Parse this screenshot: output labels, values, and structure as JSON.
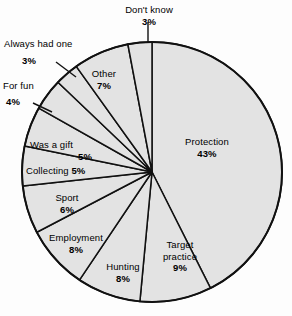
{
  "chart_data": {
    "type": "pie",
    "title": "",
    "subtitle": "",
    "xlabel": "",
    "ylabel": "",
    "legend_position": "none",
    "grid": false,
    "units": "percent",
    "start_angle_deg": 0,
    "direction": "clockwise",
    "categories": [
      "Protection",
      "Target practice",
      "Hunting",
      "Employment",
      "Sport",
      "Collecting",
      "Was a gift",
      "For fun",
      "Always had one",
      "Other",
      "Don't know"
    ],
    "values": [
      43,
      9,
      8,
      8,
      6,
      5,
      5,
      4,
      3,
      7,
      3
    ],
    "slices": [
      {
        "name": "Protection",
        "value": 43,
        "label": "Protection",
        "percent_label": "43%",
        "label_style": "inside-stacked"
      },
      {
        "name": "Target practice",
        "value": 9,
        "label": "Target",
        "label_line2": "practice",
        "percent_label": "9%",
        "label_style": "inside-stacked"
      },
      {
        "name": "Hunting",
        "value": 8,
        "label": "Hunting",
        "percent_label": "8%",
        "label_style": "inside-stacked"
      },
      {
        "name": "Employment",
        "value": 8,
        "label": "Employment",
        "percent_label": "8%",
        "label_style": "inside-stacked"
      },
      {
        "name": "Sport",
        "value": 6,
        "label": "Sport",
        "percent_label": "6%",
        "label_style": "inside-stacked"
      },
      {
        "name": "Collecting",
        "value": 5,
        "label": "Collecting",
        "percent_label": "5%",
        "label_style": "inside-inline"
      },
      {
        "name": "Was a gift",
        "value": 5,
        "label": "Was a gift",
        "percent_label": "5%",
        "label_style": "inside-stacked"
      },
      {
        "name": "For fun",
        "value": 4,
        "label": "For fun",
        "percent_label": "4%",
        "label_style": "outside-leader"
      },
      {
        "name": "Always had one",
        "value": 3,
        "label": "Always had one",
        "percent_label": "3%",
        "label_style": "outside-leader"
      },
      {
        "name": "Other",
        "value": 7,
        "label": "Other",
        "percent_label": "7%",
        "label_style": "inside-stacked"
      },
      {
        "name": "Don't know",
        "value": 3,
        "label": "Don't know",
        "percent_label": "3%",
        "label_style": "outside-leader"
      }
    ],
    "colors": {
      "slice_fill": "#e3e3e3",
      "slice_stroke": "#111111",
      "text": "#000000",
      "background": "#fdfdfd"
    }
  },
  "labels": {
    "protection": {
      "name": "Protection",
      "percent": "43%"
    },
    "target_practice": {
      "name": "Target",
      "name2": "practice",
      "percent": "9%"
    },
    "hunting": {
      "name": "Hunting",
      "percent": "8%"
    },
    "employment": {
      "name": "Employment",
      "percent": "8%"
    },
    "sport": {
      "name": "Sport",
      "percent": "6%"
    },
    "collecting": {
      "name": "Collecting",
      "percent": "5%"
    },
    "was_a_gift": {
      "name": "Was a gift",
      "percent": "5%"
    },
    "for_fun": {
      "name": "For fun",
      "percent": "4%"
    },
    "always_had_one": {
      "name": "Always had one",
      "percent": "3%"
    },
    "other": {
      "name": "Other",
      "percent": "7%"
    },
    "dont_know": {
      "name": "Don't know",
      "percent": "3%"
    }
  }
}
